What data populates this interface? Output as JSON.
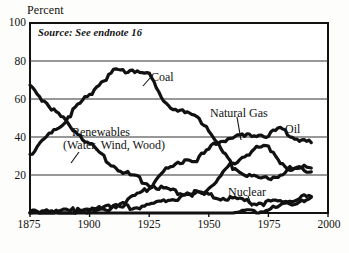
{
  "chart_data": {
    "type": "line",
    "title": "",
    "subtitle": "",
    "source_note": "Source: See endnote 16",
    "xlabel": "",
    "ylabel": "Percent",
    "xlim": [
      1875,
      2000
    ],
    "ylim": [
      0,
      100
    ],
    "xticks": [
      "1875",
      "1900",
      "1925",
      "1950",
      "1975",
      "2000"
    ],
    "yticks": [
      "100",
      "80",
      "60",
      "40",
      "20"
    ],
    "grid": "horizontal",
    "legend_position": "inline-labels",
    "x": [
      1875,
      1880,
      1885,
      1890,
      1895,
      1900,
      1905,
      1910,
      1915,
      1920,
      1925,
      1930,
      1935,
      1940,
      1945,
      1950,
      1955,
      1960,
      1965,
      1970,
      1975,
      1980,
      1985,
      1990,
      1993
    ],
    "series": [
      {
        "name": "Renewables (Water, Wind, Wood)",
        "label": "Renewables",
        "label2": "(Water, Wind, Wood)",
        "values": [
          67,
          61,
          55,
          49,
          43,
          37,
          31,
          26,
          22,
          19,
          16,
          14,
          12,
          11,
          11,
          10,
          9,
          8,
          7,
          6,
          6,
          7,
          8,
          9,
          9
        ]
      },
      {
        "name": "Coal",
        "label": "Coal",
        "values": [
          32,
          38,
          44,
          50,
          57,
          63,
          70,
          75,
          76,
          76,
          73,
          62,
          56,
          53,
          52,
          45,
          34,
          25,
          22,
          19,
          19,
          21,
          23,
          24,
          23
        ]
      },
      {
        "name": "Oil",
        "label": "Oil",
        "values": [
          1,
          1,
          1,
          2,
          2,
          2,
          3,
          5,
          7,
          10,
          14,
          22,
          25,
          29,
          29,
          34,
          39,
          41,
          41,
          42,
          42,
          45,
          41,
          39,
          37
        ]
      },
      {
        "name": "Natural Gas",
        "label": "Natural Gas",
        "values": [
          0,
          1,
          1,
          1,
          2,
          2,
          3,
          3,
          4,
          4,
          5,
          7,
          8,
          10,
          11,
          14,
          20,
          27,
          31,
          35,
          36,
          28,
          23,
          25,
          25
        ]
      },
      {
        "name": "Nuclear",
        "label": "Nuclear",
        "values": [
          0,
          0,
          0,
          0,
          0,
          0,
          0,
          0,
          0,
          0,
          0,
          0,
          0,
          0,
          0,
          0,
          0,
          0,
          1,
          1,
          3,
          4,
          6,
          8,
          8
        ]
      }
    ],
    "annotations": [
      {
        "text": "Coal",
        "leader": true
      },
      {
        "text": "Renewables",
        "leader": true
      },
      {
        "text": "Natural Gas",
        "leader": true
      },
      {
        "text": "Oil",
        "leader": false
      },
      {
        "text": "Nuclear",
        "leader": true
      }
    ]
  },
  "axis": {
    "y_title": "Percent"
  },
  "colors": {
    "line": "#111111",
    "frame": "#111111",
    "grid": "#333333",
    "background": "#ffffff"
  }
}
